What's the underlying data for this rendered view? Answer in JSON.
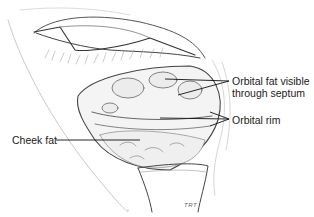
{
  "figure": {
    "style": "pencil line drawing, grayscale"
  },
  "labels": {
    "orbital_fat": "Orbital fat visible\nthrough septum",
    "orbital_fat_line1": "Orbital fat visible",
    "orbital_fat_line2": "through septum",
    "orbital_rim": "Orbital rim",
    "cheek_fat": "Cheek fat"
  },
  "signature": "TRT",
  "colors": {
    "background": "#ffffff",
    "ink": "#1a1a1a",
    "shading": "#8a8a8a",
    "light_shading": "#c8c8c8"
  }
}
